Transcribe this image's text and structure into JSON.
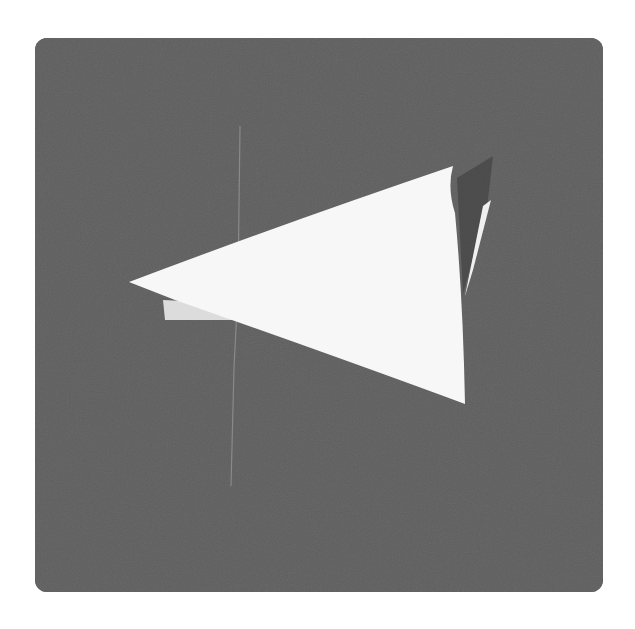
{
  "scene": {
    "description": "Folded white paper triangle on a dark gray board",
    "colors": {
      "page_background": "#ffffff",
      "board": "#5e5e5e",
      "paper": "#f7f7f7",
      "paper_shadow": "#d8d8d8",
      "thread": "#8a8a8a"
    }
  }
}
